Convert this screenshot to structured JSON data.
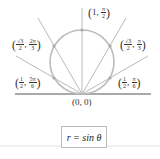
{
  "diagram": {
    "curve_equation": "r = sin θ",
    "origin_label": "(0, 0)",
    "points": [
      {
        "r": "1",
        "theta_num": "π",
        "theta_den": "2",
        "label": "(1, π/2)"
      },
      {
        "r_num": "√3",
        "r_den": "2",
        "theta_num": "2π",
        "theta_den": "3",
        "label": "(√3/2, 2π/3)"
      },
      {
        "r_num": "√3",
        "r_den": "2",
        "theta_num": "π",
        "theta_den": "3",
        "label": "(√3/2, π/3)"
      },
      {
        "r_num": "1",
        "r_den": "2",
        "theta_num": "5π",
        "theta_den": "6",
        "label": "(1/2, 5π/6)"
      },
      {
        "r_num": "1",
        "r_den": "2",
        "theta_num": "π",
        "theta_den": "6",
        "label": "(1/2, π/6)"
      }
    ],
    "colors": {
      "circle": "#b8b8b8",
      "rays": "#a0a0a0",
      "axis": "#555555"
    }
  }
}
